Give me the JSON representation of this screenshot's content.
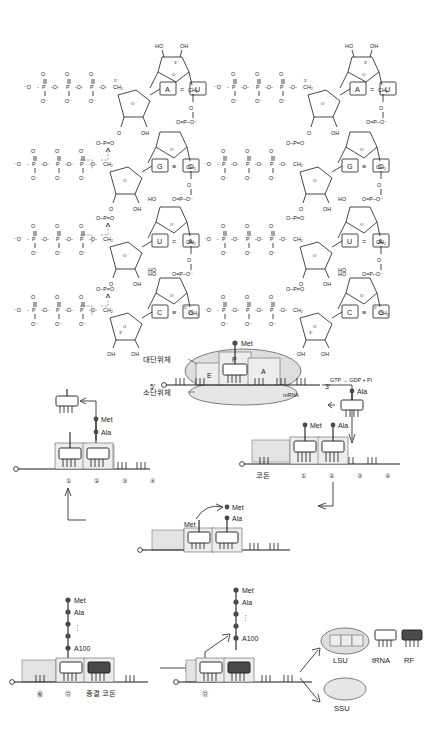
{
  "figure": {
    "colors": {
      "ink": "#1a1a1a",
      "ribosome": "#dedede",
      "rf": "#4a4a4a",
      "shade": "#e3e3e3"
    }
  },
  "chem": {
    "pairs_left": [
      {
        "left": "A",
        "bond": "=",
        "right": "U"
      },
      {
        "left": "G",
        "bond": "≡",
        "right": "C"
      },
      {
        "left": "U",
        "bond": "=",
        "right": "A"
      },
      {
        "left": "C",
        "bond": "≡",
        "right": "G"
      }
    ],
    "pairs_right": [
      {
        "left": "A",
        "bond": "=",
        "right": "U"
      },
      {
        "left": "G",
        "bond": "≡",
        "right": "C"
      },
      {
        "left": "U",
        "bond": "=",
        "right": "A"
      },
      {
        "left": "C",
        "bond": "≡",
        "right": "G"
      }
    ],
    "atoms": {
      "o": "O",
      "o_minus": "⁻O",
      "o_minus_r": "O⁻",
      "p": "P",
      "ch2": "CH₂",
      "oh": "OH",
      "ho": "HO",
      "phosphate_link": "O–P=O",
      "phosphate_link_r": "O=P–O⁻",
      "prime5": "5′",
      "prime3": "3′"
    }
  },
  "ribosome": {
    "large_subunit_ko": "대단위체",
    "small_subunit_ko": "소단위체",
    "sites": [
      "E",
      "P",
      "A"
    ],
    "mrna_label": "mRNA",
    "five_prime": "5′",
    "three_prime": "3′",
    "met": "Met"
  },
  "cycle": {
    "gtp": "GTP → GDP + Pi",
    "ala": "Ala",
    "met": "Met",
    "met_ala": "Met",
    "ala2": "Ala",
    "codon_ko": "코돈",
    "stop_codon_ko": "종결 코돈",
    "a100": "A100",
    "codon_numbers": [
      "①",
      "②",
      "③",
      "④"
    ],
    "codon_numbers_end": [
      "㊙",
      "㊘"
    ],
    "ellipsis": "⋮"
  },
  "legend": {
    "lsu": "LSU",
    "ssu": "SSU",
    "trna": "tRNA",
    "rf": "RF"
  }
}
